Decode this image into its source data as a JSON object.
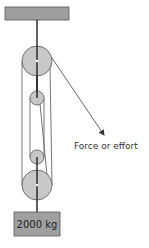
{
  "diagram": {
    "effort_label": "Force or effort",
    "load_label": "2000 kg",
    "colors": {
      "ceiling_fill": "#9e9e9e",
      "pulley_fill": "#c8c8c8",
      "weight_fill": "#a0a0a0",
      "stroke": "#444444",
      "rope": "#666666",
      "rod": "#222222"
    },
    "components": {
      "ceiling": "fixed support beam",
      "upper_pulleys": [
        "large fixed pulley",
        "small fixed pulley"
      ],
      "lower_pulleys": [
        "small movable pulley",
        "large movable pulley"
      ],
      "load": "weight block"
    }
  }
}
